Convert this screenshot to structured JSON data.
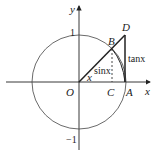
{
  "diagram": {
    "axes": {
      "x_label": "x",
      "y_label": "y",
      "tick_top": "1",
      "tick_bottom": "−1"
    },
    "points": {
      "origin": "O",
      "A": "A",
      "B": "B",
      "C": "C",
      "D": "D"
    },
    "annotations": {
      "angle": "x",
      "sine": "sinx",
      "tangent": "tanx"
    },
    "colors": {
      "stroke": "#222222",
      "background": "#ffffff"
    }
  }
}
